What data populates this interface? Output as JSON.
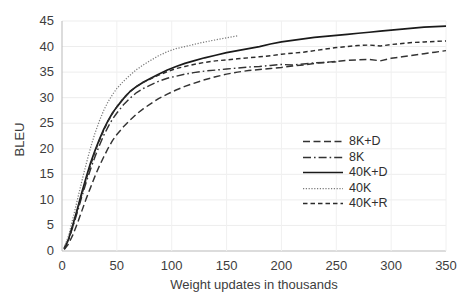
{
  "chart_data": {
    "type": "line",
    "title": "",
    "xlabel": "Weight updates in thousands",
    "ylabel": "BLEU",
    "xlim": [
      0,
      350
    ],
    "ylim": [
      0,
      45
    ],
    "xticks": [
      0,
      50,
      100,
      150,
      200,
      250,
      300,
      350
    ],
    "yticks": [
      0,
      5,
      10,
      15,
      20,
      25,
      30,
      35,
      40,
      45
    ],
    "grid": "both-faint",
    "legend_position": "center-right",
    "series": [
      {
        "name": "8K+D",
        "style": "dashed",
        "color": "#333333",
        "x": [
          2,
          6,
          10,
          14,
          18,
          22,
          26,
          30,
          34,
          38,
          42,
          46,
          50,
          56,
          62,
          68,
          74,
          80,
          88,
          96,
          104,
          112,
          120,
          130,
          140,
          150,
          160,
          170,
          180,
          190,
          200,
          210,
          220,
          230,
          240,
          250,
          260,
          270,
          280,
          290,
          300,
          310,
          320,
          330,
          340,
          350
        ],
        "y": [
          0.3,
          1.4,
          3.2,
          5.4,
          7.8,
          10.2,
          12.4,
          14.6,
          16.6,
          18.4,
          20.1,
          21.6,
          22.8,
          24.3,
          25.6,
          26.8,
          27.8,
          28.7,
          29.8,
          30.7,
          31.5,
          32.2,
          32.8,
          33.5,
          34.1,
          34.6,
          35.0,
          35.3,
          35.5,
          35.7,
          35.9,
          36.2,
          36.4,
          36.7,
          36.9,
          37.1,
          37.3,
          37.4,
          37.5,
          37.2,
          37.7,
          38.0,
          38.3,
          38.6,
          38.9,
          39.2
        ]
      },
      {
        "name": "8K",
        "style": "dashdot",
        "color": "#333333",
        "x": [
          2,
          6,
          10,
          14,
          18,
          22,
          26,
          30,
          34,
          38,
          42,
          46,
          50,
          56,
          62,
          68,
          74,
          80,
          88,
          96,
          104,
          112,
          120,
          130,
          140,
          150,
          160,
          170,
          180,
          190,
          200,
          210,
          220,
          230,
          240,
          250
        ],
        "y": [
          0.4,
          2.2,
          4.8,
          7.6,
          10.6,
          13.4,
          16.0,
          18.4,
          20.6,
          22.6,
          24.3,
          25.8,
          27.0,
          28.6,
          29.9,
          31.0,
          31.8,
          32.4,
          33.2,
          33.8,
          34.2,
          34.6,
          34.9,
          35.2,
          35.4,
          35.6,
          35.8,
          36.0,
          36.1,
          36.3,
          36.5,
          36.4,
          36.6,
          36.8,
          36.9,
          37.0
        ]
      },
      {
        "name": "40K+D",
        "style": "solid",
        "color": "#1a1a1a",
        "x": [
          2,
          6,
          10,
          14,
          18,
          22,
          26,
          30,
          34,
          38,
          42,
          46,
          50,
          56,
          62,
          68,
          74,
          80,
          88,
          96,
          104,
          112,
          120,
          130,
          140,
          150,
          160,
          170,
          180,
          190,
          200,
          210,
          220,
          230,
          240,
          250,
          260,
          270,
          280,
          290,
          300,
          310,
          320,
          330,
          340,
          350
        ],
        "y": [
          0.5,
          2.4,
          5.2,
          8.2,
          11.4,
          14.4,
          17.2,
          19.6,
          21.8,
          23.8,
          25.5,
          27.0,
          28.2,
          29.8,
          31.2,
          32.2,
          33.0,
          33.7,
          34.6,
          35.4,
          36.1,
          36.7,
          37.2,
          37.8,
          38.3,
          38.8,
          39.2,
          39.6,
          40.0,
          40.5,
          40.9,
          41.2,
          41.5,
          41.8,
          42.0,
          42.2,
          42.4,
          42.6,
          42.8,
          43.0,
          43.2,
          43.4,
          43.6,
          43.8,
          43.9,
          44.0
        ]
      },
      {
        "name": "40K",
        "style": "dotted",
        "color": "#7a7a7a",
        "x": [
          2,
          6,
          10,
          14,
          18,
          22,
          26,
          30,
          34,
          38,
          42,
          46,
          50,
          56,
          62,
          68,
          74,
          80,
          88,
          96,
          104,
          112,
          120,
          130,
          140,
          150,
          160
        ],
        "y": [
          0.6,
          3.0,
          6.4,
          10.0,
          13.6,
          17.0,
          20.2,
          23.0,
          25.4,
          27.5,
          29.2,
          30.6,
          31.8,
          33.2,
          34.4,
          35.5,
          36.4,
          37.2,
          38.2,
          39.0,
          39.6,
          40.0,
          40.4,
          40.9,
          41.3,
          41.7,
          42.1
        ]
      },
      {
        "name": "40K+R",
        "style": "dashed-short",
        "color": "#2b2b2b",
        "x": [
          2,
          6,
          10,
          14,
          18,
          22,
          26,
          30,
          34,
          38,
          42,
          46,
          50,
          56,
          62,
          68,
          74,
          80,
          88,
          96,
          104,
          112,
          120,
          130,
          140,
          150,
          160,
          170,
          180,
          190,
          200,
          210,
          220,
          230,
          240,
          250,
          260,
          270,
          280,
          290,
          300,
          310,
          320,
          330,
          340,
          350
        ],
        "y": [
          0.4,
          2.2,
          5.0,
          8.0,
          11.0,
          14.0,
          16.8,
          19.4,
          21.6,
          23.6,
          25.4,
          26.9,
          28.2,
          29.9,
          31.2,
          32.2,
          33.0,
          33.6,
          34.4,
          35.1,
          35.7,
          36.1,
          36.5,
          36.9,
          37.2,
          37.4,
          37.6,
          37.8,
          38.0,
          38.2,
          38.5,
          38.7,
          38.9,
          39.2,
          39.5,
          39.8,
          40.0,
          40.2,
          40.3,
          40.1,
          40.4,
          40.6,
          40.8,
          40.9,
          41.0,
          41.1
        ]
      }
    ]
  },
  "legend": {
    "items": [
      {
        "label": "8K+D"
      },
      {
        "label": "8K"
      },
      {
        "label": "40K+D"
      },
      {
        "label": "40K"
      },
      {
        "label": "40K+R"
      }
    ]
  }
}
